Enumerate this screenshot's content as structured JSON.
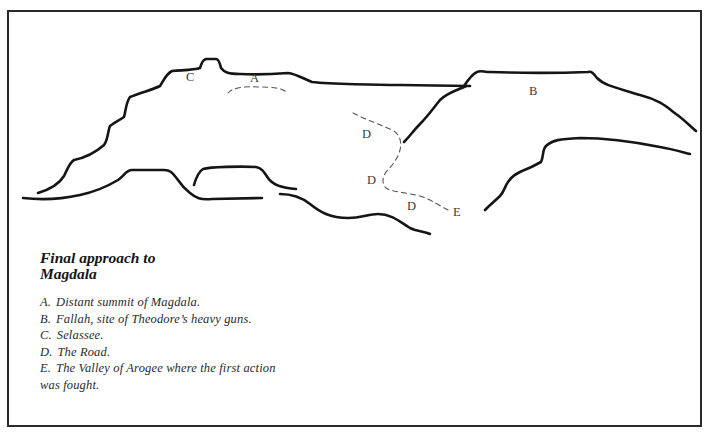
{
  "figure": {
    "title": "Final approach to\nMagdala",
    "map_labels": [
      {
        "id": "label-c",
        "text": "C",
        "x": 186,
        "y": 81
      },
      {
        "id": "label-a",
        "text": "A",
        "x": 250,
        "y": 82
      },
      {
        "id": "label-b",
        "text": "B",
        "x": 529,
        "y": 95
      },
      {
        "id": "label-d1",
        "text": "D",
        "x": 362,
        "y": 138
      },
      {
        "id": "label-d2",
        "text": "D",
        "x": 367,
        "y": 184
      },
      {
        "id": "label-d3",
        "text": "D",
        "x": 407,
        "y": 210
      },
      {
        "id": "label-e",
        "text": "E",
        "x": 453,
        "y": 216
      }
    ],
    "legend": [
      {
        "key": "A.",
        "text": "Distant summit of Magdala."
      },
      {
        "key": "B.",
        "text": "Fallah, site of Theodore’s heavy guns."
      },
      {
        "key": "C.",
        "text": "Selassee."
      },
      {
        "key": "D.",
        "text": "The Road."
      },
      {
        "key": "E.",
        "text": "The Valley of Arogee where the first action"
      },
      {
        "key": "",
        "text": "was fought."
      }
    ]
  }
}
